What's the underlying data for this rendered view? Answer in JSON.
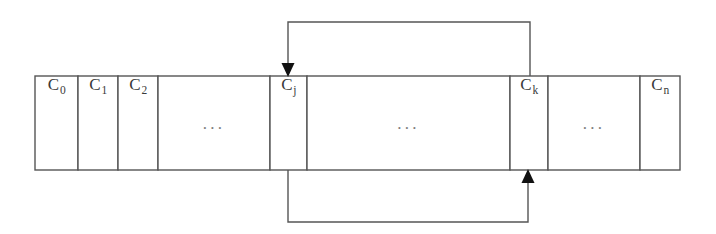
{
  "diagram": {
    "canvas": {
      "width": 716,
      "height": 234,
      "background": "#ffffff"
    },
    "stroke_color": "#555555",
    "text_color": "#3a3a3a",
    "ellipsis_color": "#7d7d7d",
    "strip": {
      "x": 35,
      "y": 76,
      "width": 645,
      "height": 94
    },
    "cells": [
      {
        "id": "c0",
        "kind": "label",
        "base": "C",
        "sub": "0",
        "x": 35,
        "width": 43
      },
      {
        "id": "c1",
        "kind": "label",
        "base": "C",
        "sub": "1",
        "x": 78,
        "width": 40
      },
      {
        "id": "c2",
        "kind": "label",
        "base": "C",
        "sub": "2",
        "x": 118,
        "width": 40
      },
      {
        "id": "gap1",
        "kind": "ellipsis",
        "text": "...",
        "x": 158,
        "width": 112
      },
      {
        "id": "cj",
        "kind": "label",
        "base": "C",
        "sub": "j",
        "x": 270,
        "width": 37
      },
      {
        "id": "gap2",
        "kind": "ellipsis",
        "text": "...",
        "x": 307,
        "width": 203
      },
      {
        "id": "ck",
        "kind": "label",
        "base": "C",
        "sub": "k",
        "x": 510,
        "width": 38
      },
      {
        "id": "gap3",
        "kind": "ellipsis",
        "text": "...",
        "x": 548,
        "width": 92
      },
      {
        "id": "cn",
        "kind": "label",
        "base": "C",
        "sub": "n",
        "x": 640,
        "width": 40
      }
    ],
    "arrows": [
      {
        "id": "top-feedback-arrow",
        "name": "feedback-arrow-ck-to-cj",
        "from_cell": "ck",
        "to_cell": "cj",
        "path": "M 530 76 L 530 22 L 288 22 L 288 68",
        "head": {
          "x": 288,
          "y": 76,
          "direction": "down"
        }
      },
      {
        "id": "bottom-feedback-arrow",
        "name": "feedback-arrow-cj-to-ck",
        "from_cell": "cj",
        "to_cell": "ck",
        "path": "M 288 170 L 288 222 L 528 222 L 528 178",
        "head": {
          "x": 528,
          "y": 170,
          "direction": "up"
        }
      }
    ]
  }
}
